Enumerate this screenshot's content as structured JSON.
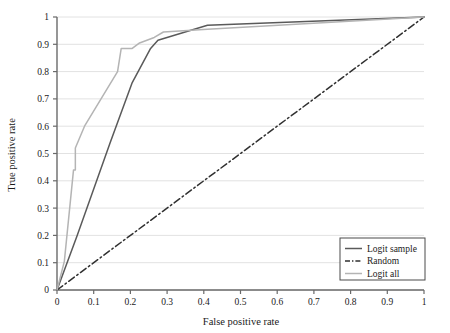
{
  "chart_data": {
    "type": "line",
    "title": "",
    "xlabel": "False positive rate",
    "ylabel": "True positive rate",
    "xlim": [
      0,
      1
    ],
    "ylim": [
      0,
      1
    ],
    "xticks": [
      "0",
      "0.1",
      "0.2",
      "0.3",
      "0.4",
      "0.5",
      "0.6",
      "0.7",
      "0.8",
      "0.9",
      "1"
    ],
    "xtick_values": [
      0,
      0.1,
      0.2,
      0.3,
      0.4,
      0.5,
      0.6,
      0.7,
      0.8,
      0.9,
      1
    ],
    "yticks": [
      "0",
      "0.1",
      "0.2",
      "0.3",
      "0.4",
      "0.5",
      "0.6",
      "0.7",
      "0.8",
      "0.9",
      "1"
    ],
    "ytick_values": [
      0,
      0.1,
      0.2,
      0.3,
      0.4,
      0.5,
      0.6,
      0.7,
      0.8,
      0.9,
      1
    ],
    "grid": "horizontal",
    "grid_color": "#e2e2e2",
    "legend_position": "bottom-right",
    "series": [
      {
        "name": "Logit sample",
        "color": "#5a5a5a",
        "style": "solid",
        "x": [
          0,
          0.055,
          0.145,
          0.205,
          0.255,
          0.275,
          0.41,
          1
        ],
        "y": [
          0,
          0.2,
          0.54,
          0.76,
          0.885,
          0.915,
          0.97,
          1
        ]
      },
      {
        "name": "Random",
        "color": "#303030",
        "style": "dashdot",
        "x": [
          0,
          1
        ],
        "y": [
          0,
          1
        ]
      },
      {
        "name": "Logit all",
        "color": "#b4b4b4",
        "style": "solid",
        "x": [
          0,
          0.02,
          0.045,
          0.05,
          0.05,
          0.075,
          0.12,
          0.165,
          0.175,
          0.205,
          0.225,
          0.265,
          0.29,
          0.41,
          1
        ],
        "y": [
          0,
          0.105,
          0.44,
          0.44,
          0.52,
          0.6,
          0.7,
          0.8,
          0.885,
          0.885,
          0.905,
          0.925,
          0.945,
          0.955,
          1
        ]
      }
    ]
  },
  "legend": {
    "items": [
      {
        "label": "Logit sample",
        "color": "#5a5a5a",
        "style": "solid"
      },
      {
        "label": "Random",
        "color": "#303030",
        "style": "dashdot"
      },
      {
        "label": "Logit all",
        "color": "#b4b4b4",
        "style": "solid"
      }
    ]
  }
}
